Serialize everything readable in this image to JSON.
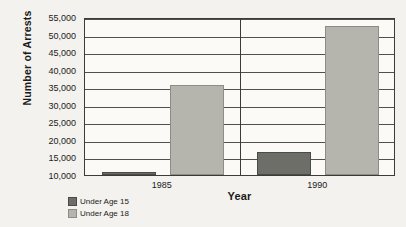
{
  "chart_data": {
    "type": "bar",
    "title": "",
    "xlabel": "Year",
    "ylabel": "Number of Arrests",
    "categories": [
      "1985",
      "1990"
    ],
    "series": [
      {
        "name": "Under Age 15",
        "color": "#6e6e68",
        "values": [
          10900,
          16500
        ]
      },
      {
        "name": "Under Age 18",
        "color": "#b5b4ad",
        "values": [
          35700,
          52300
        ]
      }
    ],
    "ylim": [
      10000,
      55000
    ],
    "yticks": [
      55000,
      50000,
      45000,
      40000,
      35000,
      30000,
      25000,
      20000,
      15000,
      10000
    ],
    "ytick_labels": [
      "55,000",
      "50,000",
      "45,000",
      "40,000",
      "35,000",
      "30,000",
      "25,000",
      "20,000",
      "15,000",
      "10,000"
    ],
    "grid": true,
    "legend_position": "below-left"
  },
  "legend": {
    "items": [
      {
        "label": "Under Age 15"
      },
      {
        "label": "Under Age 18"
      }
    ]
  }
}
